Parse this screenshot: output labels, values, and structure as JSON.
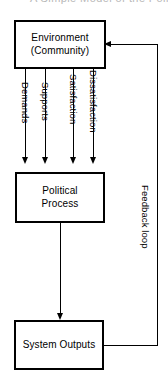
{
  "diagram": {
    "title_artifact": "A Simple Model of the Political System",
    "nodes": [
      {
        "id": "environment",
        "label": "Environment\n(Community)"
      },
      {
        "id": "political-process",
        "label": "Political\nProcess"
      },
      {
        "id": "system-outputs",
        "label": "System Outputs"
      }
    ],
    "flow_labels": [
      {
        "id": "demands",
        "label": "Demands"
      },
      {
        "id": "supports",
        "label": "Supports"
      },
      {
        "id": "satisfaction",
        "label": "Satisfaction"
      },
      {
        "id": "dissatisfaction",
        "label": "Dissatisfaction"
      }
    ],
    "feedback": {
      "label": "Feedback loop"
    },
    "colors": {
      "stroke": "#000000",
      "background": "#ffffff",
      "text": "#000000"
    }
  }
}
